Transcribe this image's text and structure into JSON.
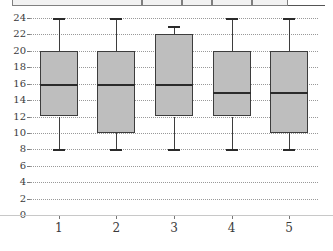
{
  "top_strip": {
    "present": true,
    "note": "cut-off table header row above the chart",
    "cell_lefts": [
      12,
      142,
      182,
      212,
      252,
      288
    ]
  },
  "axes": {
    "y_tick_labels": [
      "0",
      "2",
      "4",
      "6",
      "8",
      "10",
      "12",
      "14",
      "16",
      "18",
      "20",
      "22",
      "24"
    ],
    "x_tick_labels": [
      "1",
      "2",
      "3",
      "4",
      "5"
    ]
  },
  "style": {
    "box_fill": "#bebebe",
    "box_stroke": "#3d3d3d",
    "median_color": "#2b2b2b",
    "gridline_color": "#999999",
    "text_color": "#3a3a3a",
    "background": "#ffffff"
  },
  "chart_data": {
    "type": "box",
    "title": "",
    "xlabel": "",
    "ylabel": "",
    "categories": [
      "1",
      "2",
      "3",
      "4",
      "5"
    ],
    "ylim": [
      0,
      24
    ],
    "ytick_step": 2,
    "grid": true,
    "legend": false,
    "boxes": [
      {
        "category": "1",
        "whisker_low": 8,
        "q1": 12,
        "median": 16,
        "q3": 20,
        "whisker_high": 24
      },
      {
        "category": "2",
        "whisker_low": 8,
        "q1": 10,
        "median": 16,
        "q3": 20,
        "whisker_high": 24
      },
      {
        "category": "3",
        "whisker_low": 8,
        "q1": 12,
        "median": 16,
        "q3": 22,
        "whisker_high": 23
      },
      {
        "category": "4",
        "whisker_low": 8,
        "q1": 12,
        "median": 15,
        "q3": 20,
        "whisker_high": 24
      },
      {
        "category": "5",
        "whisker_low": 8,
        "q1": 10,
        "median": 15,
        "q3": 20,
        "whisker_high": 24
      }
    ]
  }
}
